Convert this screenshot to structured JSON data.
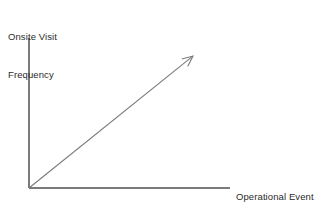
{
  "figure": {
    "background_color": "#ffffff",
    "line_color": "#7a7a7a",
    "text_color": "#2b2b2b",
    "axis_stroke_width": 1.1,
    "trend_stroke_width": 1.1
  },
  "axes": {
    "y_axis": {
      "name": "y-axis-line",
      "label_line_1": "Onsite Visit",
      "label_line_2": "Frequency",
      "x": 29,
      "y_top": 38,
      "y_bottom": 188
    },
    "x_axis": {
      "name": "x-axis-line",
      "label_line_1": "Operational Event",
      "label_line_2": "Negative Severity",
      "y": 188,
      "x_left": 29,
      "x_right": 230
    }
  },
  "trend_arrow": {
    "name": "trend-arrow",
    "from_x": 29,
    "from_y": 188,
    "to_x": 193,
    "to_y": 56,
    "arrowhead": "open-v",
    "direction": "up-right",
    "meaning": "positive correlation"
  },
  "chart_data": {
    "type": "line",
    "title": "",
    "subtitle": "",
    "xlabel": "Operational Event Negative Severity",
    "ylabel": "Onsite Visit Frequency",
    "xlim": [
      0,
      1
    ],
    "ylim": [
      0,
      1
    ],
    "grid": false,
    "legend": false,
    "ticks": {
      "x": [],
      "y": []
    },
    "annotations": [],
    "series": [
      {
        "name": "Positive trend",
        "style": "arrow",
        "x": [
          0,
          1
        ],
        "y": [
          0,
          1
        ]
      }
    ]
  }
}
